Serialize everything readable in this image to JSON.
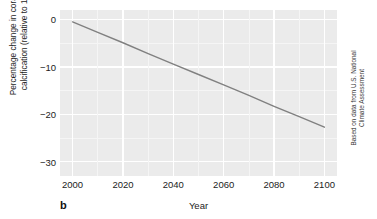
{
  "chart_data": {
    "type": "line",
    "title": "",
    "panel_label": "b",
    "xlabel": "Year",
    "ylabel_line1": "Percentage change in coral reef",
    "ylabel_line2": "calcification (relative to 1990)",
    "xlim": [
      1995,
      2105
    ],
    "ylim": [
      -33,
      2
    ],
    "xticks": [
      "2000",
      "2020",
      "2040",
      "2060",
      "2080",
      "2100"
    ],
    "xtick_values": [
      2000,
      2020,
      2040,
      2060,
      2080,
      2100
    ],
    "yticks": [
      "0",
      "−10",
      "−20",
      "−30"
    ],
    "ytick_values": [
      0,
      -10,
      -20,
      -30
    ],
    "grid": true,
    "legend": "none",
    "series": [
      {
        "name": "Coral reef calcification change",
        "color": "#808080",
        "x": [
          2000,
          2010,
          2020,
          2030,
          2040,
          2050,
          2060,
          2070,
          2080,
          2090,
          2100
        ],
        "values": [
          -0.5,
          -2.7,
          -4.9,
          -7.2,
          -9.4,
          -11.6,
          -13.8,
          -16.0,
          -18.3,
          -20.5,
          -22.7
        ]
      }
    ],
    "source_credit_line1": "Based on data from U.S. National",
    "source_credit_line2": "Climate Assessment",
    "panel_background": "#ebebeb",
    "gridline_color": "#ffffff",
    "figure_background": "#ffffff"
  }
}
